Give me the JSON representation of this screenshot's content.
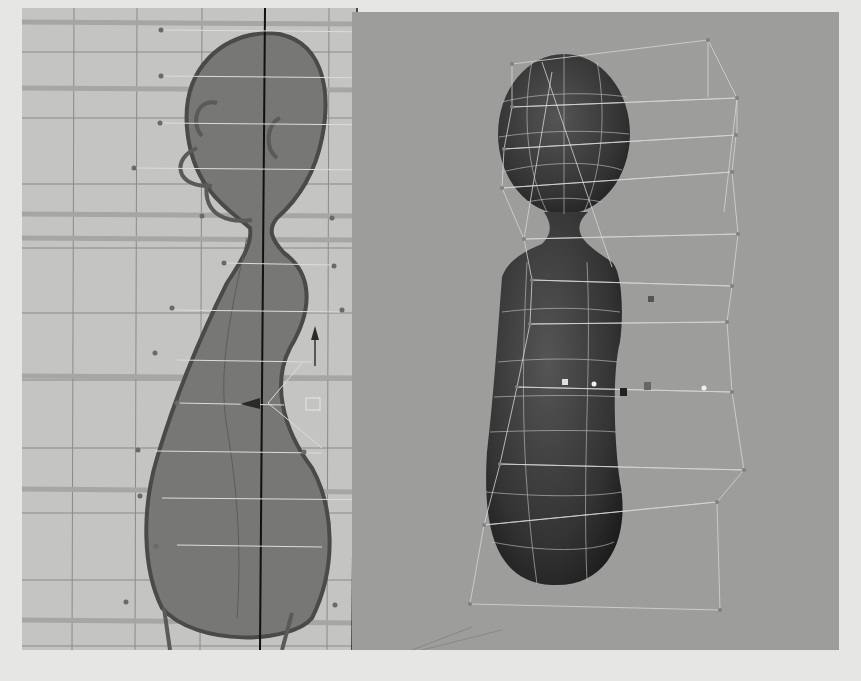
{
  "viewports": [
    {
      "name": "side-view",
      "background": "#c4c4c2",
      "content": "character side profile over reference sketch with lattice"
    },
    {
      "name": "perspective-view",
      "background": "#9d9d9b",
      "content": "shaded character mesh with lattice deformer cage"
    }
  ],
  "colors": {
    "page": "#e6e6e4",
    "grid": "#8a8a88",
    "mesh": "#3c3c3c",
    "lattice": "#d8d8d8"
  }
}
